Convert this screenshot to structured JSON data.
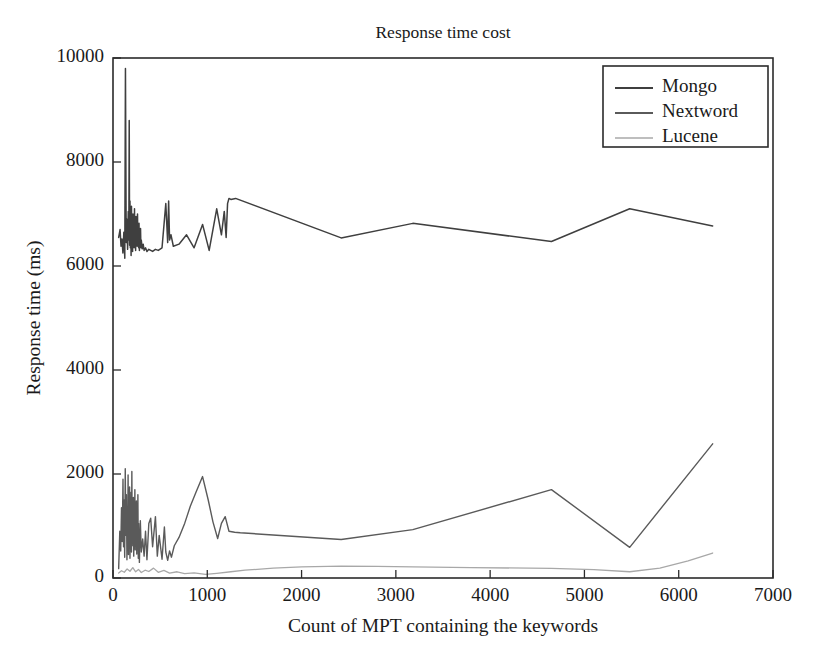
{
  "chart_data": {
    "type": "line",
    "title": "Response time cost",
    "xlabel": "Count of MPT containing the keywords",
    "ylabel": "Response time (ms)",
    "xlim": [
      0,
      7000
    ],
    "ylim": [
      0,
      10000
    ],
    "xticks": [
      0,
      1000,
      2000,
      3000,
      4000,
      5000,
      6000,
      7000
    ],
    "yticks": [
      0,
      2000,
      4000,
      6000,
      8000,
      10000
    ],
    "xtick_labels": [
      "0",
      "1000",
      "2000",
      "3000",
      "4000",
      "5000",
      "6000",
      "7000"
    ],
    "ytick_labels": [
      "0",
      "2000",
      "4000",
      "6000",
      "8000",
      "10000"
    ],
    "grid": false,
    "legend_position": "upper right",
    "legend_entries": [
      "Mongo",
      "Nextword",
      "Lucene"
    ],
    "series": [
      {
        "name": "Mongo",
        "color": "#3f3f3f",
        "width": 1.5,
        "x": [
          60,
          75,
          85,
          95,
          105,
          115,
          125,
          132,
          140,
          148,
          155,
          162,
          168,
          172,
          176,
          180,
          184,
          188,
          192,
          196,
          200,
          204,
          208,
          212,
          216,
          220,
          224,
          228,
          232,
          236,
          240,
          244,
          248,
          252,
          256,
          260,
          264,
          268,
          272,
          276,
          280,
          284,
          288,
          292,
          296,
          300,
          310,
          320,
          330,
          345,
          360,
          380,
          400,
          420,
          450,
          480,
          520,
          560,
          580,
          590,
          600,
          615,
          640,
          700,
          780,
          860,
          950,
          1020,
          1100,
          1150,
          1180,
          1200,
          1215,
          1230,
          1250,
          1300,
          2420,
          3180,
          4650,
          5480,
          6360
        ],
        "y": [
          6550,
          6700,
          6380,
          6520,
          6250,
          6650,
          6150,
          9800,
          6450,
          6900,
          6320,
          7050,
          6500,
          8800,
          6400,
          7250,
          6350,
          6850,
          6200,
          7150,
          6500,
          6950,
          6280,
          7000,
          6420,
          6750,
          6350,
          7100,
          6400,
          6880,
          6300,
          6950,
          6500,
          6650,
          6380,
          7000,
          6420,
          6700,
          6350,
          6820,
          6300,
          6600,
          6400,
          6720,
          6350,
          6500,
          6330,
          6420,
          6300,
          6350,
          6280,
          6320,
          6300,
          6280,
          6320,
          6300,
          6350,
          7200,
          6450,
          7250,
          6500,
          6600,
          6380,
          6420,
          6600,
          6350,
          6800,
          6300,
          7100,
          6600,
          7050,
          6550,
          7200,
          7300,
          7280,
          7300,
          6540,
          6820,
          6470,
          7100,
          6770
        ]
      },
      {
        "name": "Nextword",
        "color": "#5a5a5a",
        "width": 1.4,
        "x": [
          60,
          72,
          82,
          90,
          98,
          106,
          112,
          118,
          124,
          130,
          136,
          142,
          148,
          152,
          156,
          160,
          164,
          168,
          172,
          176,
          180,
          184,
          188,
          192,
          196,
          200,
          204,
          208,
          212,
          216,
          220,
          224,
          228,
          232,
          236,
          240,
          244,
          248,
          252,
          256,
          260,
          264,
          268,
          272,
          276,
          280,
          290,
          300,
          315,
          330,
          345,
          360,
          380,
          400,
          420,
          450,
          470,
          490,
          520,
          545,
          560,
          580,
          600,
          620,
          650,
          700,
          760,
          820,
          880,
          950,
          1010,
          1060,
          1110,
          1150,
          1190,
          1230,
          1290,
          1350,
          2420,
          3180,
          4650,
          5480,
          6360
        ],
        "y": [
          180,
          900,
          520,
          1350,
          700,
          1900,
          600,
          1500,
          400,
          2100,
          820,
          1600,
          350,
          1250,
          650,
          1980,
          450,
          1400,
          700,
          1750,
          380,
          1200,
          900,
          1650,
          500,
          2050,
          620,
          1300,
          780,
          1550,
          420,
          1100,
          880,
          1700,
          540,
          1250,
          700,
          1480,
          460,
          1150,
          820,
          1600,
          380,
          1050,
          640,
          300,
          1100,
          500,
          750,
          420,
          900,
          350,
          1050,
          1150,
          600,
          1180,
          420,
          820,
          360,
          980,
          500,
          340,
          520,
          400,
          620,
          780,
          1050,
          1380,
          1650,
          1950,
          1500,
          1080,
          760,
          1050,
          1180,
          900,
          880,
          870,
          740,
          930,
          1700,
          590,
          2580
        ]
      },
      {
        "name": "Lucene",
        "color": "#a8a8a8",
        "width": 1.3,
        "x": [
          60,
          90,
          120,
          150,
          180,
          210,
          240,
          270,
          300,
          340,
          380,
          430,
          480,
          540,
          600,
          680,
          760,
          860,
          980,
          1100,
          1250,
          1400,
          1700,
          2000,
          2420,
          2800,
          3180,
          3800,
          4650,
          5100,
          5480,
          5800,
          6100,
          6360
        ],
        "y": [
          95,
          140,
          110,
          175,
          130,
          200,
          120,
          165,
          105,
          150,
          125,
          190,
          110,
          145,
          95,
          120,
          85,
          100,
          70,
          90,
          120,
          150,
          190,
          215,
          230,
          225,
          215,
          200,
          185,
          160,
          120,
          190,
          330,
          480
        ]
      }
    ]
  }
}
